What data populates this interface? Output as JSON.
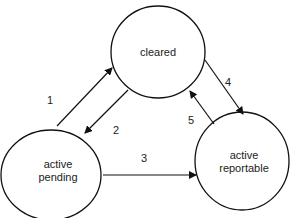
{
  "diagram": {
    "type": "state-transition",
    "states": [
      {
        "id": "cleared",
        "label_lines": [
          "cleared"
        ]
      },
      {
        "id": "active_pending",
        "label_lines": [
          "active",
          "pending"
        ]
      },
      {
        "id": "active_reportable",
        "label_lines": [
          "active",
          "reportable"
        ]
      }
    ],
    "transitions": [
      {
        "label": "1",
        "from": "active_pending",
        "to": "cleared"
      },
      {
        "label": "2",
        "from": "cleared",
        "to": "active_pending"
      },
      {
        "label": "3",
        "from": "active_pending",
        "to": "active_reportable"
      },
      {
        "label": "4",
        "from": "cleared",
        "to": "active_reportable"
      },
      {
        "label": "5",
        "from": "active_reportable",
        "to": "cleared"
      }
    ]
  }
}
